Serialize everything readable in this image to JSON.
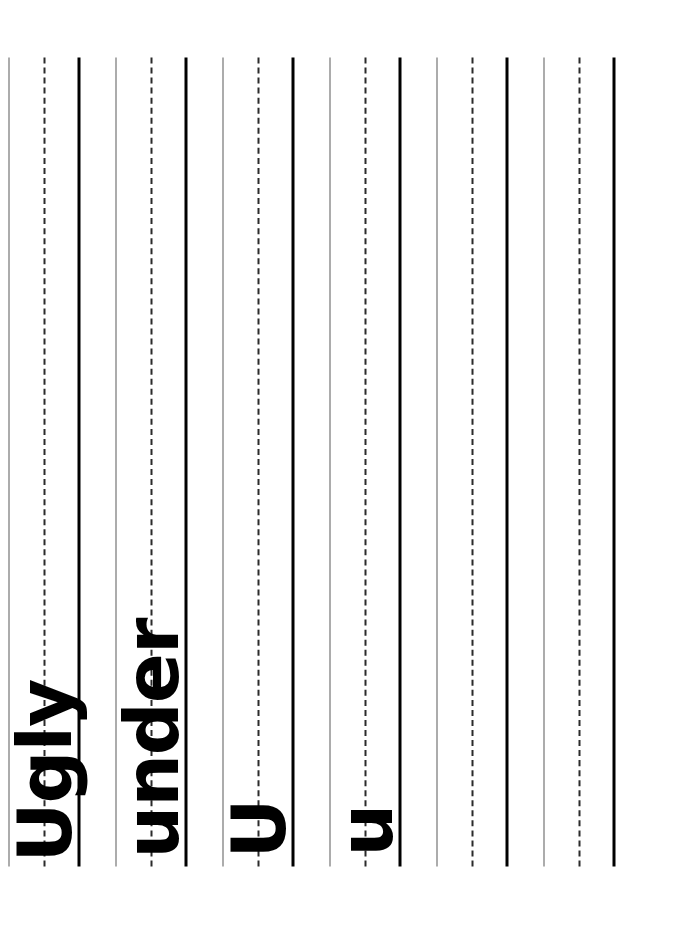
{
  "page": {
    "kind": "handwriting-practice-worksheet",
    "orientation": "rotated-90-ccw",
    "background_color": "#ffffff",
    "width": 683,
    "height": 950
  },
  "rule_colors": {
    "top_line": "#5a5a5a",
    "mid_dashed_line": "#2b2b2b",
    "baseline": "#000000",
    "ink": "#000000"
  },
  "rows": [
    {
      "index": 1,
      "text": "Ugly",
      "style": "mixed",
      "filled": true
    },
    {
      "index": 2,
      "text": "under",
      "style": "lowercase",
      "filled": true
    },
    {
      "index": 3,
      "text": "U",
      "style": "uppercase",
      "filled": true
    },
    {
      "index": 4,
      "text": "u",
      "style": "lowercase",
      "filled": true
    },
    {
      "index": 5,
      "text": "",
      "style": "blank",
      "filled": false
    },
    {
      "index": 6,
      "text": "",
      "style": "blank",
      "filled": false
    }
  ]
}
